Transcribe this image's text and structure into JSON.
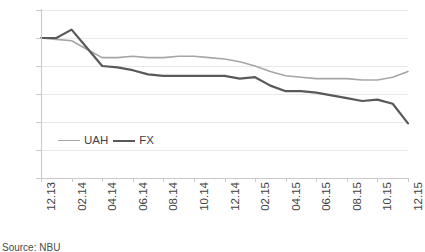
{
  "chart_data": {
    "type": "line",
    "title": "",
    "xlabel": "",
    "ylabel": "",
    "ylim": [
      0,
      120
    ],
    "ytick_values": [
      0,
      20,
      40,
      60,
      80,
      100,
      120
    ],
    "ytick_labels": [
      "0%",
      "20%",
      "40%",
      "60%",
      "80%",
      "100%",
      "120%"
    ],
    "grid": true,
    "legend_position": "inside-lower-left",
    "x": [
      "12.13",
      "01.14",
      "02.14",
      "03.14",
      "04.14",
      "05.14",
      "06.14",
      "07.14",
      "08.14",
      "09.14",
      "10.14",
      "11.14",
      "12.14",
      "01.15",
      "02.15",
      "03.15",
      "04.15",
      "05.15",
      "06.15",
      "07.15",
      "08.15",
      "09.15",
      "10.15",
      "11.15",
      "12.15"
    ],
    "xtick_labels": [
      "12.13",
      "02.14",
      "04.14",
      "06.14",
      "08.14",
      "10.14",
      "12.14",
      "02.15",
      "04.15",
      "06.15",
      "08.15",
      "10.15",
      "12.15"
    ],
    "xtick_indices": [
      0,
      2,
      4,
      6,
      8,
      10,
      12,
      14,
      16,
      18,
      20,
      22,
      24
    ],
    "series": [
      {
        "name": "UAH",
        "color": "#a6a6a6",
        "values": [
          100,
          99,
          98,
          92,
          86,
          86,
          87,
          86,
          86,
          87,
          87,
          86,
          85,
          83,
          80,
          76,
          73,
          72,
          71,
          71,
          71,
          70,
          70,
          72,
          76
        ]
      },
      {
        "name": "FX",
        "color": "#595959",
        "values": [
          100,
          100,
          106,
          93,
          80,
          79,
          77,
          74,
          73,
          73,
          73,
          73,
          73,
          71,
          72,
          66,
          62,
          62,
          61,
          59,
          57,
          55,
          56,
          53,
          39
        ]
      }
    ]
  },
  "legend": {
    "items": [
      {
        "label": "UAH",
        "color": "#a6a6a6"
      },
      {
        "label": "FX",
        "color": "#595959"
      }
    ]
  },
  "footer": {
    "source": "Source: NBU"
  }
}
